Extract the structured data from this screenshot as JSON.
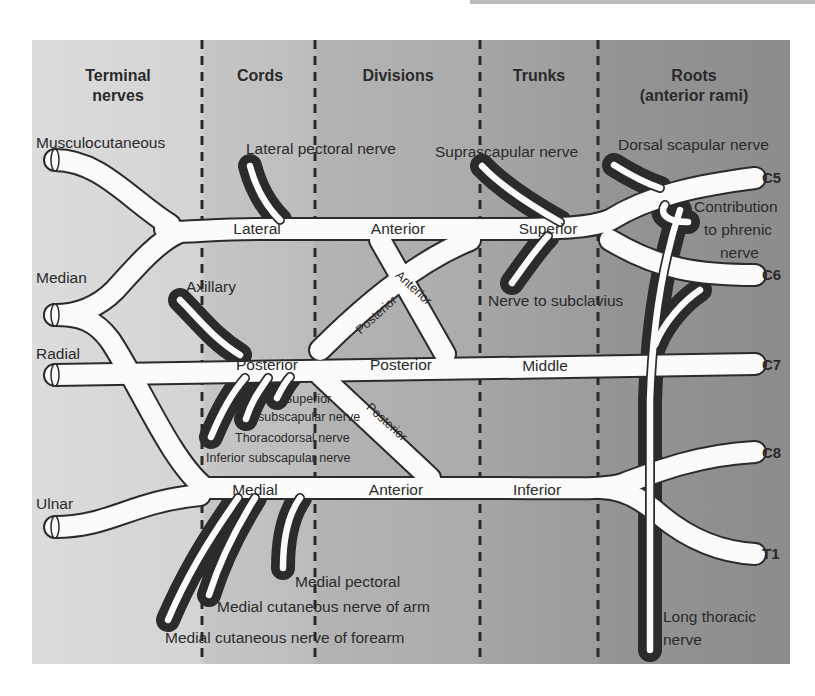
{
  "columns": [
    {
      "id": "terminal",
      "label_line1": "Terminal",
      "label_line2": "nerves",
      "color": "#d9d9d9"
    },
    {
      "id": "cords",
      "label_line1": "Cords",
      "label_line2": "",
      "color": "#c4c4c4"
    },
    {
      "id": "divisions",
      "label_line1": "Divisions",
      "label_line2": "",
      "color": "#b3b3b3"
    },
    {
      "id": "trunks",
      "label_line1": "Trunks",
      "label_line2": "",
      "color": "#a3a3a3"
    },
    {
      "id": "roots",
      "label_line1": "Roots",
      "label_line2": "(anterior rami)",
      "color": "#929292"
    }
  ],
  "roots": [
    "C5",
    "C6",
    "C7",
    "C8",
    "T1"
  ],
  "trunks": {
    "superior": "Superior",
    "middle": "Middle",
    "inferior": "Inferior"
  },
  "divisions": {
    "anterior_top": "Anterior",
    "anterior_diag": "Anterior",
    "posterior_diag_up": "Posterior",
    "posterior_mid": "Posterior",
    "posterior_diag_low": "Posterior",
    "anterior_bottom": "Anterior"
  },
  "cords": {
    "lateral": "Lateral",
    "posterior": "Posterior",
    "medial": "Medial"
  },
  "terminal_nerves": {
    "musculocutaneous": "Musculocutaneous",
    "median": "Median",
    "radial": "Radial",
    "ulnar": "Ulnar",
    "axillary": "Axillary"
  },
  "branches": {
    "dorsal_scapular": "Dorsal scapular nerve",
    "suprascapular": "Suprascapular nerve",
    "lateral_pectoral": "Lateral pectoral nerve",
    "nerve_to_subclavius": "Nerve to subclavius",
    "phrenic_line1": "Contribution",
    "phrenic_line2": "to phrenic",
    "phrenic_line3": "nerve",
    "superior_subscapular_line1": "Superior",
    "superior_subscapular_line2": "subscapular nerve",
    "thoracodorsal": "Thoracodorsal nerve",
    "inferior_subscapular": "Inferior subscapular nerve",
    "medial_pectoral": "Medial pectoral",
    "medial_cutaneous_arm": "Medial cutaneous nerve of arm",
    "medial_cutaneous_forearm": "Medial cutaneous nerve of forearm",
    "long_thoracic_line1": "Long thoracic",
    "long_thoracic_line2": "nerve"
  }
}
